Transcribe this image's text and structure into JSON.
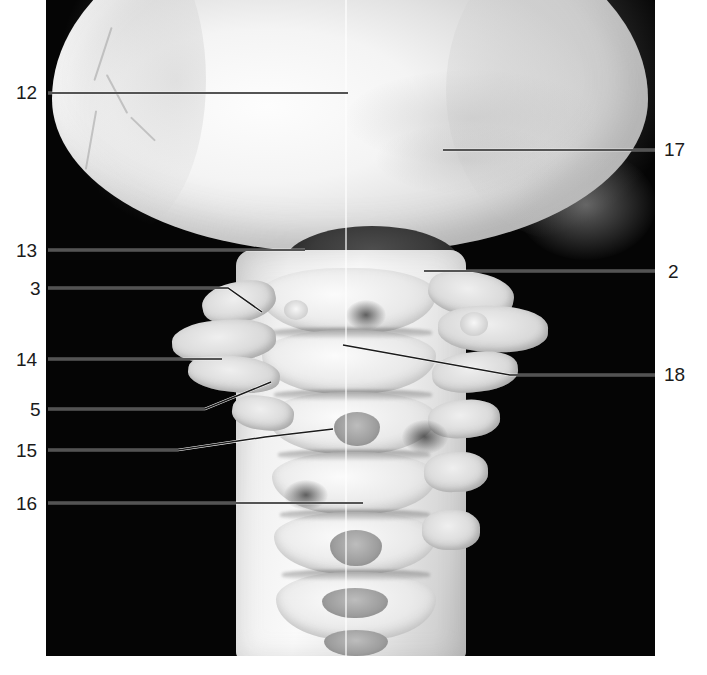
{
  "figure": {
    "type": "anatomical-photograph",
    "background_color": "#ffffff",
    "plate_color": "#050505"
  },
  "plate": {
    "x": 46,
    "y": 0,
    "width": 609,
    "height": 656
  },
  "labels": [
    {
      "id": "12",
      "text": "12",
      "side": "left",
      "x": 16,
      "y": 83,
      "line": [
        [
          48,
          93
        ],
        [
          348,
          93
        ]
      ],
      "line_color": "#1b1b1b"
    },
    {
      "id": "17",
      "text": "17",
      "side": "right",
      "x": 664,
      "y": 140,
      "line": [
        [
          443,
          150
        ],
        [
          655,
          150
        ]
      ],
      "line_color": "#1b1b1b"
    },
    {
      "id": "13",
      "text": "13",
      "side": "left",
      "x": 16,
      "y": 241,
      "line": [
        [
          48,
          250
        ],
        [
          305,
          250
        ]
      ],
      "line_color": "#1b1b1b"
    },
    {
      "id": "2",
      "text": "2",
      "side": "right",
      "x": 668,
      "y": 262,
      "line": [
        [
          424,
          271
        ],
        [
          655,
          271
        ]
      ],
      "line_color": "#1b1b1b"
    },
    {
      "id": "3",
      "text": "3",
      "side": "left",
      "x": 30,
      "y": 279,
      "line": [
        [
          48,
          288
        ],
        [
          228,
          288
        ],
        [
          262,
          312
        ]
      ],
      "line_color": "#1b1b1b"
    },
    {
      "id": "14",
      "text": "14",
      "side": "left",
      "x": 16,
      "y": 350,
      "line": [
        [
          48,
          359
        ],
        [
          222,
          359
        ]
      ],
      "line_color": "#1b1b1b"
    },
    {
      "id": "18",
      "text": "18",
      "side": "right",
      "x": 664,
      "y": 365,
      "line": [
        [
          343,
          345
        ],
        [
          510,
          375
        ],
        [
          655,
          375
        ]
      ],
      "line_color": "#1b1b1b"
    },
    {
      "id": "5",
      "text": "5",
      "side": "left",
      "x": 30,
      "y": 400,
      "line": [
        [
          48,
          409
        ],
        [
          205,
          409
        ],
        [
          271,
          382
        ]
      ],
      "line_color": "#1b1b1b"
    },
    {
      "id": "15",
      "text": "15",
      "side": "left",
      "x": 16,
      "y": 441,
      "line": [
        [
          48,
          450
        ],
        [
          178,
          450
        ],
        [
          265,
          437
        ],
        [
          333,
          429
        ]
      ],
      "line_color": "#1b1b1b"
    },
    {
      "id": "16",
      "text": "16",
      "side": "left",
      "x": 16,
      "y": 494,
      "line": [
        [
          48,
          503
        ],
        [
          363,
          503
        ]
      ],
      "line_color": "#1b1b1b"
    }
  ],
  "scan_line": {
    "x": 345,
    "color": "rgba(255,255,255,0.62)"
  }
}
